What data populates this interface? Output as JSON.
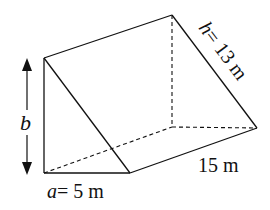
{
  "figure": {
    "type": "triangular-prism",
    "labels": {
      "height_var": "b",
      "hyp_var": "h",
      "hyp_eq": "= 13 m",
      "length": "15 m",
      "base_var": "a",
      "base_eq": "= 5 m"
    },
    "colors": {
      "stroke": "#111111",
      "background": "#ffffff"
    }
  }
}
